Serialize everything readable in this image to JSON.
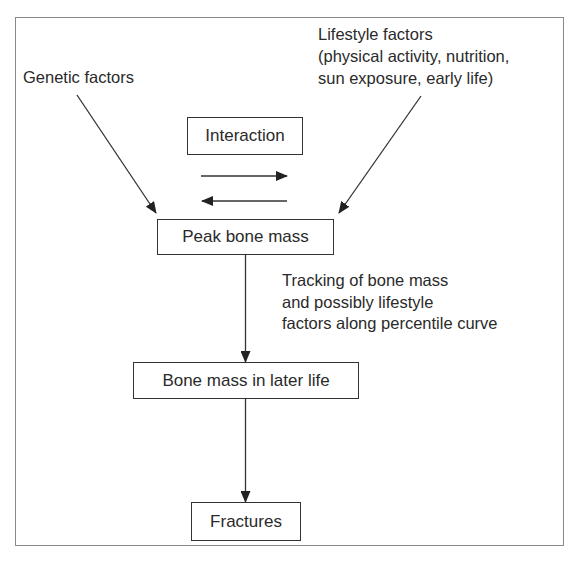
{
  "diagram": {
    "nodes": {
      "interaction": {
        "label": "Interaction"
      },
      "peak_bone_mass": {
        "label": "Peak bone mass"
      },
      "bone_mass_later_life": {
        "label": "Bone mass in later life"
      },
      "fractures": {
        "label": "Fractures"
      }
    },
    "labels": {
      "genetic_factors": {
        "text": "Genetic factors"
      },
      "lifestyle_factors": {
        "lines": [
          "Lifestyle factors",
          "(physical activity, nutrition,",
          "sun exposure, early life)"
        ]
      },
      "tracking": {
        "lines": [
          "Tracking of bone mass",
          "and possibly lifestyle",
          "factors along percentile curve"
        ]
      }
    },
    "edges": [
      {
        "from": "Genetic factors",
        "to": "Peak bone mass"
      },
      {
        "from": "Lifestyle factors",
        "to": "Peak bone mass"
      },
      {
        "from": "Interaction",
        "direction": "right"
      },
      {
        "from": "Interaction",
        "direction": "left"
      },
      {
        "from": "Peak bone mass",
        "to": "Bone mass in later life",
        "label": "Tracking of bone mass and possibly lifestyle factors along percentile curve"
      },
      {
        "from": "Bone mass in later life",
        "to": "Fractures"
      }
    ],
    "colors": {
      "line": "#2a2a2a",
      "frame": "#8a8a8a",
      "background": "#ffffff"
    }
  }
}
